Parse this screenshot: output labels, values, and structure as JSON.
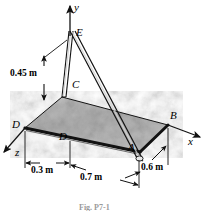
{
  "figure": {
    "caption": "Fig. P7-1",
    "axes": [
      {
        "name": "y-axis",
        "label": "y"
      },
      {
        "name": "x-axis",
        "label": "x"
      },
      {
        "name": "z-axis",
        "label": "z"
      }
    ],
    "points": [
      {
        "name": "point-E",
        "label": "E"
      },
      {
        "name": "point-C",
        "label": "C"
      },
      {
        "name": "point-B",
        "label": "B"
      },
      {
        "name": "point-A",
        "label": "A"
      },
      {
        "name": "point-D-corner",
        "label": "D"
      },
      {
        "name": "point-D-plate",
        "label": "D"
      }
    ],
    "dimensions": [
      {
        "name": "dim-height",
        "label": "0.45 m"
      },
      {
        "name": "dim-left",
        "label": "0.3 m"
      },
      {
        "name": "dim-mid",
        "label": "0.7 m"
      },
      {
        "name": "dim-right",
        "label": "0.6 m"
      }
    ],
    "colors": {
      "line": "#1a1a1a",
      "plate_fill": "#b4b4b4",
      "plate_edge": "#141414",
      "background": "#ffffff"
    }
  }
}
